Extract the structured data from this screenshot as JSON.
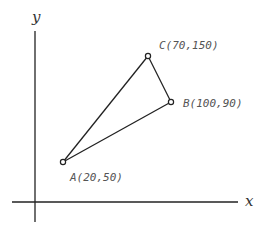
{
  "diagram": {
    "title": "",
    "axes": {
      "x_label": "x",
      "y_label": "y"
    },
    "points": [
      {
        "name": "A",
        "label": "A(20,50)",
        "x": 20,
        "y": 50
      },
      {
        "name": "B",
        "label": "B(100,90)",
        "x": 100,
        "y": 90
      },
      {
        "name": "C",
        "label": "C(70,150)",
        "x": 70,
        "y": 150
      }
    ],
    "edges": [
      [
        "A",
        "C"
      ],
      [
        "C",
        "B"
      ],
      [
        "B",
        "A"
      ]
    ],
    "colors": {
      "line": "#222222",
      "label": "#555555",
      "background": "#ffffff"
    }
  }
}
